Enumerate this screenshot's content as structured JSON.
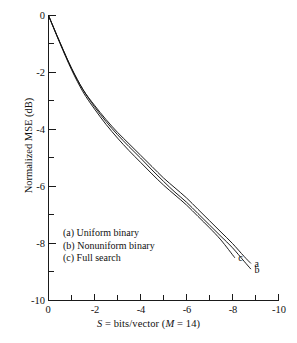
{
  "figure": {
    "background": "#ffffff",
    "ink_color": "#111111"
  },
  "chart_data": {
    "type": "line",
    "title": "",
    "xlabel": "S = bits/vector (M = 14)",
    "ylabel": "Normalized MSE (dB)",
    "xlim": [
      0,
      -10
    ],
    "ylim": [
      -10,
      0
    ],
    "x_major_ticks": [
      0,
      -2,
      -4,
      -6,
      -8,
      -10
    ],
    "x_minor_ticks": [
      -1,
      -3,
      -5,
      -7,
      -9
    ],
    "y_major_ticks": [
      0,
      -2,
      -4,
      -6,
      -8,
      -10
    ],
    "y_minor_ticks": [
      -1,
      -3,
      -5,
      -7,
      -9
    ],
    "x_tick_labels": [
      "0",
      "-2",
      "-4",
      "-6",
      "-8",
      "-10"
    ],
    "y_tick_labels": [
      "0",
      "-2",
      "-4",
      "-6",
      "-8",
      "-10"
    ],
    "grid": false,
    "legend_position": "inside-lower-left",
    "series": [
      {
        "name": "a",
        "label": "(a) Uniform binary",
        "end_tag": "a",
        "x": [
          0.0,
          -0.5,
          -1.0,
          -1.5,
          -2.0,
          -2.5,
          -3.0,
          -3.5,
          -4.0,
          -4.5,
          -5.0,
          -5.5,
          -6.0,
          -6.5,
          -7.0,
          -7.5,
          -8.0,
          -8.5,
          -8.8
        ],
        "y": [
          0.0,
          -0.95,
          -1.85,
          -2.6,
          -3.15,
          -3.65,
          -4.1,
          -4.5,
          -4.9,
          -5.3,
          -5.7,
          -6.05,
          -6.4,
          -6.8,
          -7.2,
          -7.6,
          -8.0,
          -8.45,
          -8.7
        ]
      },
      {
        "name": "b",
        "label": "(b) Nonuniform binary",
        "end_tag": "b",
        "x": [
          0.0,
          -0.5,
          -1.0,
          -1.5,
          -2.0,
          -2.5,
          -3.0,
          -3.5,
          -4.0,
          -4.5,
          -5.0,
          -5.5,
          -6.0,
          -6.5,
          -7.0,
          -7.5,
          -8.0,
          -8.5,
          -8.8
        ],
        "y": [
          0.0,
          -0.95,
          -1.85,
          -2.6,
          -3.2,
          -3.72,
          -4.18,
          -4.6,
          -5.0,
          -5.42,
          -5.82,
          -6.2,
          -6.55,
          -6.95,
          -7.35,
          -7.75,
          -8.15,
          -8.62,
          -8.9
        ]
      },
      {
        "name": "c",
        "label": "(c) Full search",
        "end_tag": "c",
        "x": [
          0.0,
          -0.5,
          -1.0,
          -1.5,
          -2.0,
          -2.5,
          -3.0,
          -3.5,
          -4.0,
          -4.5,
          -5.0,
          -5.5,
          -6.0,
          -6.5,
          -7.0,
          -7.5,
          -8.1
        ],
        "y": [
          0.0,
          -0.98,
          -1.9,
          -2.68,
          -3.28,
          -3.82,
          -4.3,
          -4.74,
          -5.15,
          -5.56,
          -5.95,
          -6.3,
          -6.65,
          -7.05,
          -7.45,
          -7.88,
          -8.5
        ]
      }
    ],
    "legend_entries": [
      "(a) Uniform binary",
      "(b) Nonuniform binary",
      "(c) Full search"
    ],
    "curve_end_labels": [
      {
        "tag": "c",
        "x": -8.1,
        "y": -8.5
      },
      {
        "tag": "a",
        "x": -8.8,
        "y": -8.7
      },
      {
        "tag": "b",
        "x": -8.8,
        "y": -8.9
      }
    ]
  }
}
